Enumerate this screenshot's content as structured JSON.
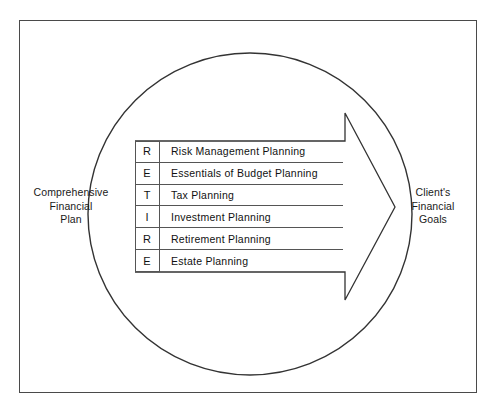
{
  "diagram": {
    "type": "process-flow",
    "left_label": {
      "lines": [
        "Comprehensive",
        "Financial",
        "Plan"
      ]
    },
    "right_label": {
      "lines": [
        "Client's",
        "Financial",
        "Goals"
      ]
    },
    "acronym": "RETIRE",
    "rows": [
      {
        "letter": "R",
        "item": "Risk Management Planning"
      },
      {
        "letter": "E",
        "item": "Essentials of Budget Planning"
      },
      {
        "letter": "T",
        "item": "Tax Planning"
      },
      {
        "letter": "I",
        "item": "Investment Planning"
      },
      {
        "letter": "R",
        "item": "Retirement Planning"
      },
      {
        "letter": "E",
        "item": "Estate Planning"
      }
    ],
    "shapes": {
      "circle": "circle-outline",
      "arrow": "right-arrow-outline",
      "frame": "page-border"
    },
    "colors": {
      "background": "#ffffff",
      "stroke": "#333333",
      "frame": "#4a4a4a",
      "text": "#111111"
    }
  }
}
